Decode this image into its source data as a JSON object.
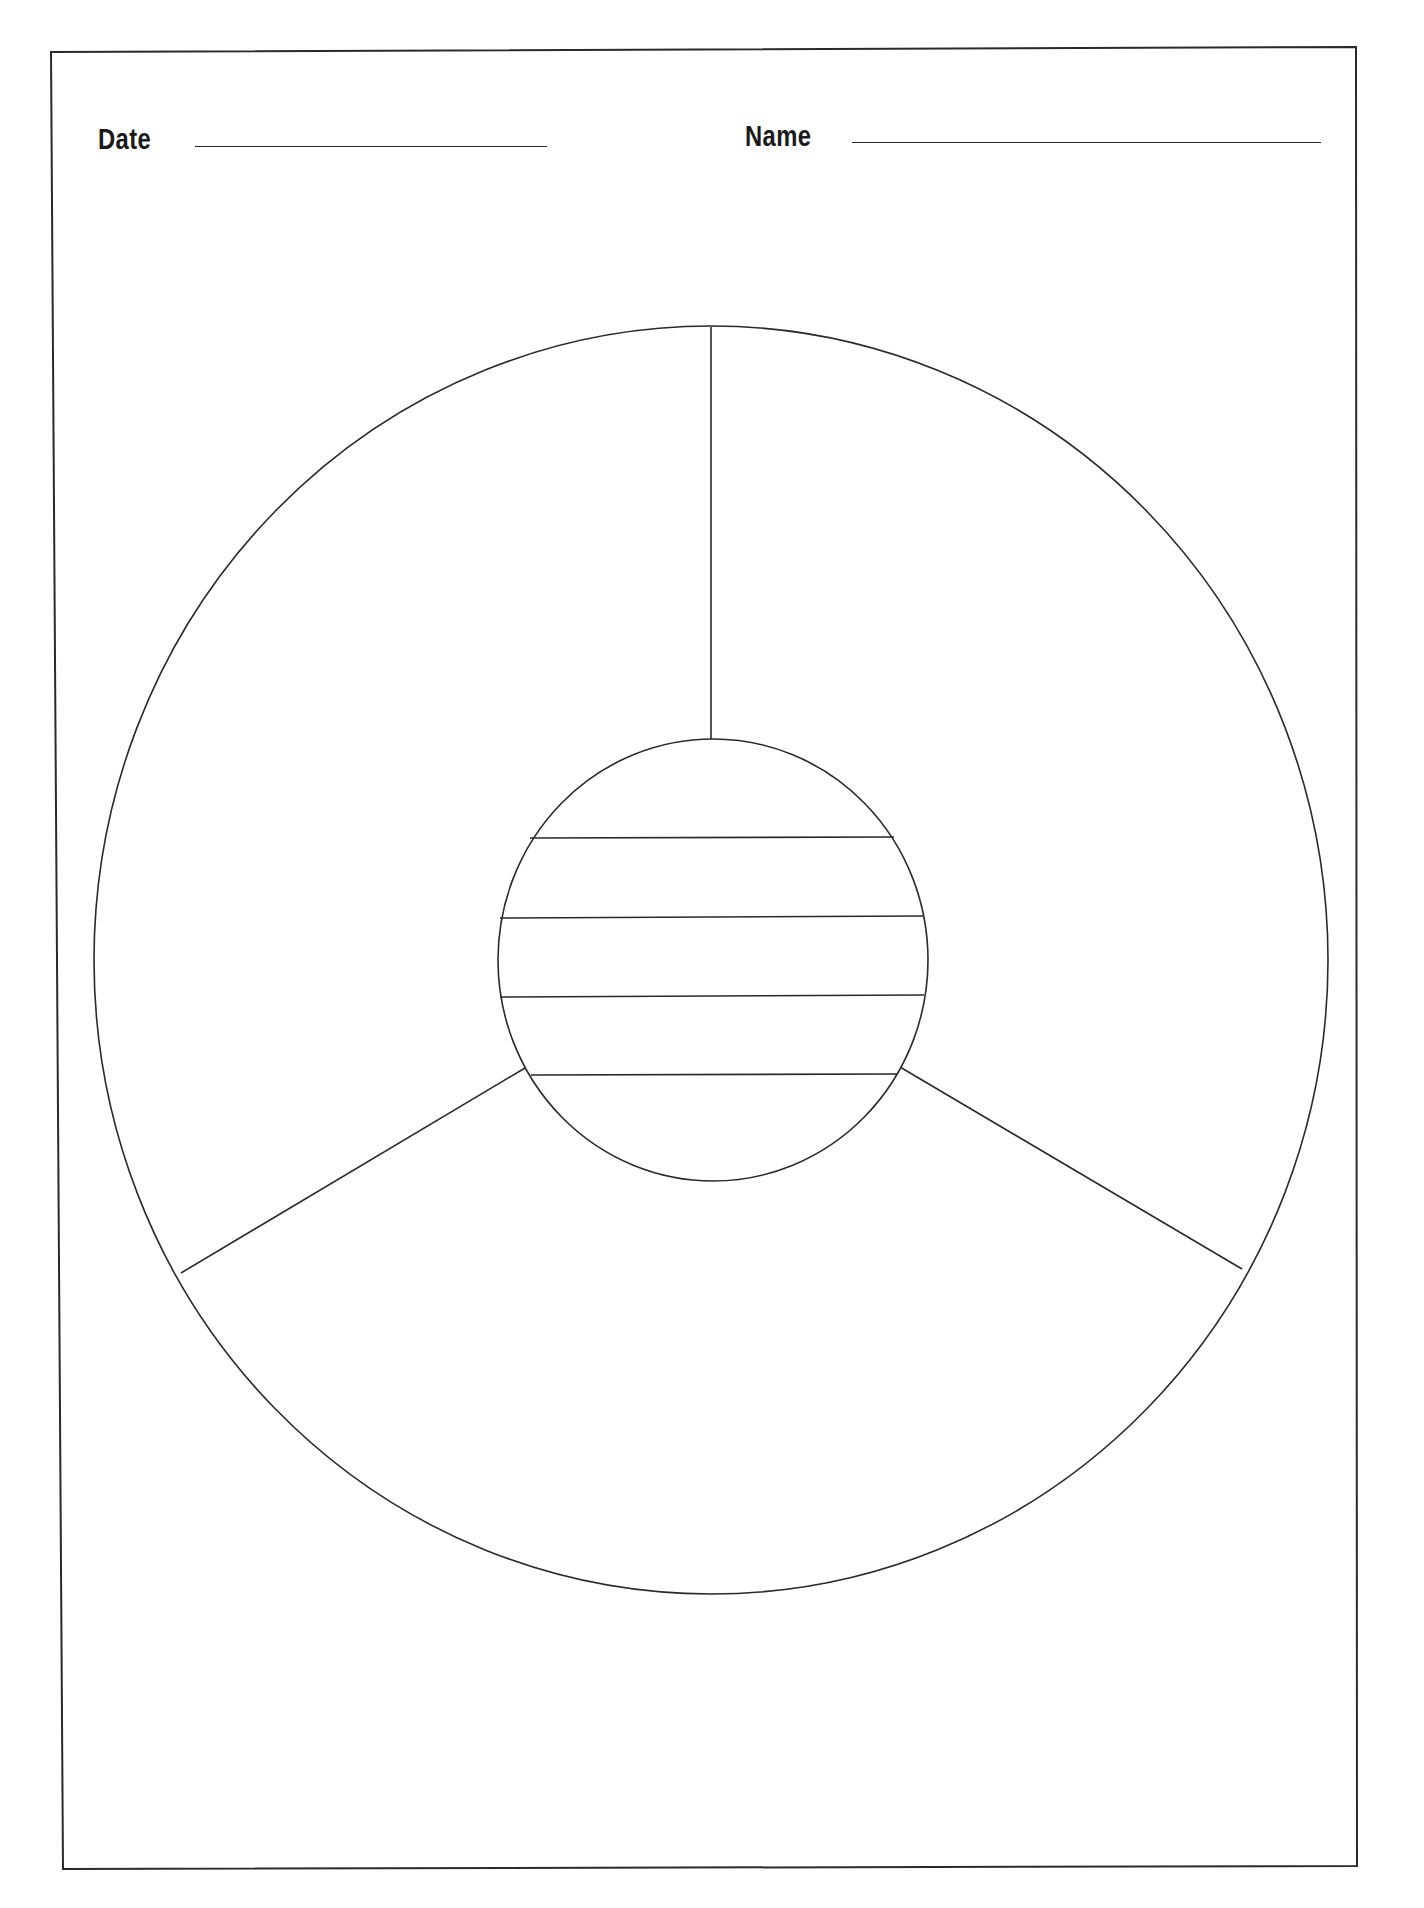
{
  "worksheet": {
    "header": {
      "date": {
        "label": "Date",
        "value": ""
      },
      "name": {
        "label": "Name",
        "value": ""
      }
    },
    "diagram": {
      "type": "circle-organizer",
      "outer_sections": 3,
      "center_lines": 4,
      "stroke_color": "#2a2a2a",
      "background_color": "#ffffff"
    }
  }
}
